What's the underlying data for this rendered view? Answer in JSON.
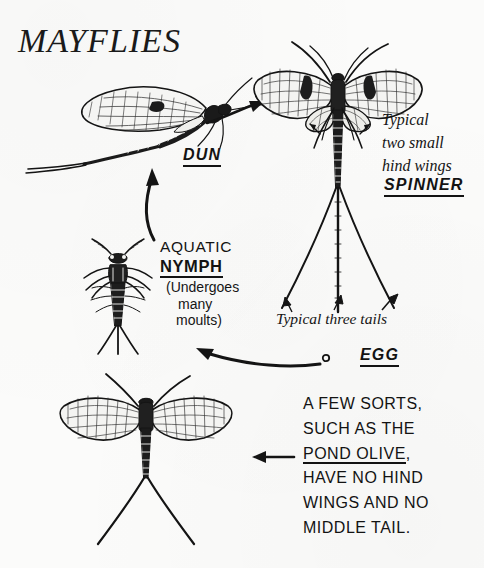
{
  "page": {
    "title": "MAYFLIES",
    "background_color": "#fbfbfa",
    "ink_color": "#131313",
    "width": 484,
    "height": 568
  },
  "labels": {
    "dun": "DUN",
    "spinner": "SPINNER",
    "egg": "EGG",
    "nymph_line1": "AQUATIC",
    "nymph_line2": "NYMPH"
  },
  "notes": {
    "hind_wings": {
      "line1": "Typical",
      "line2": "two small",
      "line3": "hind wings"
    },
    "nymph_parenthetical": {
      "line1": "(Undergoes",
      "line2": "many",
      "line3": "moults)"
    },
    "three_tails": "Typical three tails",
    "pond_olive": {
      "line1": "A FEW SORTS,",
      "line2": "SUCH AS THE",
      "line3_underlined": "POND OLIVE",
      "line3_tail": ",",
      "line4": "HAVE NO HIND",
      "line5": "WINGS AND NO",
      "line6": "MIDDLE  TAIL."
    }
  },
  "figures": {
    "dun": "mayfly-dun-side-view",
    "spinner": "mayfly-spinner-top-view",
    "nymph": "mayfly-nymph-top-view",
    "pond_olive": "mayfly-pond-olive-top-view",
    "egg": "mayfly-egg-dot"
  },
  "arrows": {
    "nymph_to_dun": "curved-arrow-up",
    "dun_to_spinner": "curved-arrow-right",
    "egg_to_nymph": "curved-arrow-left",
    "note_to_pond_olive": "straight-arrow-left"
  }
}
